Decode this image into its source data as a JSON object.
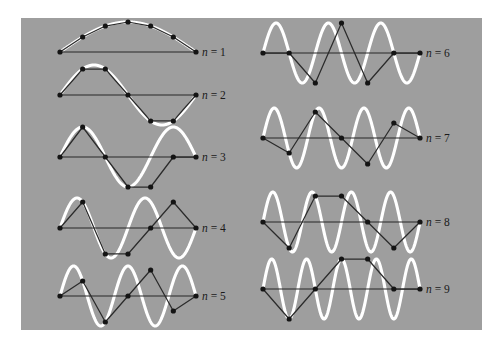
{
  "figure": {
    "kind": "normal-modes-of-discrete-chain",
    "background_color": "#9e9e9e",
    "page_color": "#ffffff",
    "continuum_wave_color": "#ffffff",
    "chain_line_color": "#2b2b2b",
    "mass_dot_color": "#141414",
    "baseline_color": "#262626",
    "panel": {
      "x": 21,
      "y": 18,
      "width": 461,
      "height": 312
    },
    "n_masses": 5,
    "n_segments": 6,
    "dot_radius": 2.6,
    "note": "Each panel: white curve = continuous standing wave sin(n*pi*x/L); black dots = 5 interior mass displacements; straight dark lines connect the masses and the two fixed ends."
  },
  "panels": [
    {
      "label": "n = 1",
      "n": 1,
      "column": "left",
      "baseline_y": 52,
      "x_left": 60,
      "x_right": 196,
      "amplitude": 30,
      "label_x": 202,
      "label_y": 56,
      "displacements": [
        0.5,
        0.866,
        1.0,
        0.866,
        0.5
      ]
    },
    {
      "label": "n = 2",
      "n": 2,
      "column": "left",
      "baseline_y": 95,
      "x_left": 60,
      "x_right": 196,
      "amplitude": 30,
      "label_x": 202,
      "label_y": 99,
      "displacements": [
        0.866,
        0.866,
        0.0,
        -0.866,
        -0.866
      ]
    },
    {
      "label": "n = 3",
      "n": 3,
      "column": "left",
      "baseline_y": 157,
      "x_left": 60,
      "x_right": 196,
      "amplitude": 30,
      "label_x": 202,
      "label_y": 161,
      "displacements": [
        1.0,
        0.0,
        -1.0,
        -1.0,
        0.0
      ]
    },
    {
      "label": "n = 4",
      "n": 4,
      "column": "left",
      "baseline_y": 228,
      "x_left": 60,
      "x_right": 196,
      "amplitude": 30,
      "label_x": 202,
      "label_y": 232,
      "displacements": [
        0.866,
        -0.866,
        -0.866,
        0.0,
        0.866
      ]
    },
    {
      "label": "n = 5",
      "n": 5,
      "column": "left",
      "baseline_y": 296,
      "x_left": 60,
      "x_right": 196,
      "amplitude": 30,
      "label_x": 202,
      "label_y": 300,
      "displacements": [
        0.5,
        -0.866,
        0.0,
        0.866,
        -0.5
      ]
    },
    {
      "label": "n = 6",
      "n": 6,
      "column": "right",
      "baseline_y": 53,
      "x_left": 263,
      "x_right": 420,
      "amplitude": 30,
      "label_x": 426,
      "label_y": 57,
      "displacements": [
        0.0,
        -1.0,
        1.0,
        -1.0,
        0.0
      ]
    },
    {
      "label": "n = 7",
      "n": 7,
      "column": "right",
      "baseline_y": 138,
      "x_left": 263,
      "x_right": 420,
      "amplitude": 30,
      "label_x": 426,
      "label_y": 142,
      "displacements": [
        -0.5,
        0.866,
        0.0,
        -0.866,
        0.5
      ]
    },
    {
      "label": "n = 8",
      "n": 8,
      "column": "right",
      "baseline_y": 222,
      "x_left": 263,
      "x_right": 420,
      "amplitude": 30,
      "label_x": 426,
      "label_y": 226,
      "displacements": [
        -0.866,
        0.866,
        0.866,
        0.0,
        -0.866
      ]
    },
    {
      "label": "n = 9",
      "n": 9,
      "column": "right",
      "baseline_y": 289,
      "x_left": 263,
      "x_right": 420,
      "amplitude": 30,
      "label_x": 426,
      "label_y": 293,
      "displacements": [
        -1.0,
        0.0,
        1.0,
        1.0,
        0.0
      ]
    }
  ]
}
